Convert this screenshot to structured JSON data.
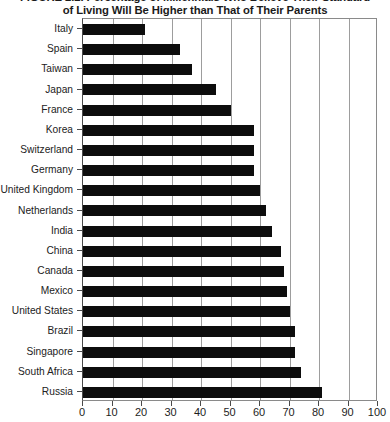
{
  "figure": {
    "title_lines": [
      "FIGURE 2.2. Percentage of Millennials Who Believe Their Standard",
      "of Living Will Be Higher than That of Their Parents"
    ]
  },
  "chart_data": {
    "type": "bar",
    "orientation": "horizontal",
    "title": "FIGURE 2.2. Percentage of Millennials Who Believe Their Standard of Living Will Be Higher than That of Their Parents",
    "xlabel": "",
    "ylabel": "",
    "xlim": [
      0,
      100
    ],
    "xticks": [
      0,
      10,
      20,
      30,
      40,
      50,
      60,
      70,
      80,
      90,
      100
    ],
    "xtick_labels": [
      "0",
      "10",
      "20",
      "30",
      "40",
      "50",
      "60",
      "70",
      "80",
      "90",
      "100"
    ],
    "grid": "vertical",
    "legend": "none",
    "bar_color": "#0d0d0d",
    "categories": [
      "Italy",
      "Spain",
      "Taiwan",
      "Japan",
      "France",
      "Korea",
      "Switzerland",
      "Germany",
      "United Kingdom",
      "Netherlands",
      "India",
      "China",
      "Canada",
      "Mexico",
      "United States",
      "Brazil",
      "Singapore",
      "South Africa",
      "Russia"
    ],
    "values": [
      21,
      33,
      37,
      45,
      50,
      58,
      58,
      58,
      60,
      62,
      64,
      67,
      68,
      69,
      70,
      72,
      72,
      74,
      81
    ]
  }
}
